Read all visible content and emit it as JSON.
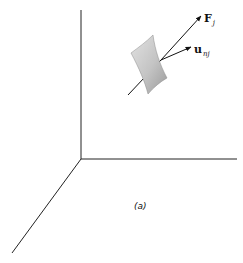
{
  "figure": {
    "caption": "(a)",
    "axes": {
      "color": "#222222",
      "vertical": {
        "x1": 81,
        "y1": 10,
        "x2": 81,
        "y2": 159
      },
      "horizontal": {
        "x1": 81,
        "y1": 159,
        "x2": 237,
        "y2": 159
      },
      "diagonal": {
        "x1": 81,
        "y1": 159,
        "x2": 12,
        "y2": 253
      }
    },
    "surface": {
      "fill_light": "#dcdcdc",
      "fill_dark": "#9a9a9a",
      "path": "M131,53 C139,47 146,42 153,35 C155,50 160,65 167,78 C160,82 154,87 148,94 C145,82 139,68 131,53 Z"
    },
    "force_vector": {
      "label": "F",
      "subscript": "j",
      "x1": 128,
      "y1": 95,
      "x2": 201,
      "y2": 16
    },
    "normal_vector": {
      "label": "u",
      "subscript": "nj",
      "x1": 161,
      "y1": 60,
      "x2": 191,
      "y2": 47
    }
  }
}
